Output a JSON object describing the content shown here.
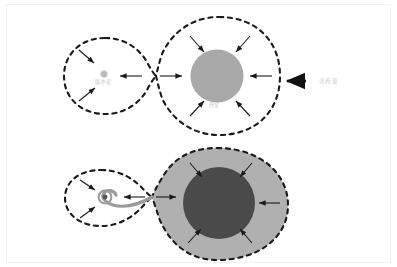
{
  "figure": {
    "background_color": "#ffffff",
    "border_color": "#f2f2f2"
  },
  "colors": {
    "dashed_stroke": "#1a1a1a",
    "companion_star_top": "#a8a8a8",
    "companion_star_bottom": "#4a4a4a",
    "roche_lobe_fill_bottom": "#b0b0b0",
    "pulsar_dot": "#a0a0a0",
    "accretion_stream": "#9a9a9a",
    "arrow_color": "#1a1a1a",
    "label_color": "#c9c9c9"
  },
  "panels": {
    "top": {
      "name": "detached-binary-panel",
      "labels": {
        "pulsar": "脉冲星",
        "companion": "伴星",
        "roche_lobe": "洛希瓣"
      }
    },
    "bottom": {
      "name": "mass-transfer-panel",
      "labels": {
        "pulsar": "",
        "companion": ""
      }
    }
  },
  "annotations": {
    "roche_lobe_pointer": "洛希瓣"
  },
  "icon_names": {
    "inward_arrow": "inward-arrow-icon",
    "outward_arrow": "outward-arrow-icon",
    "pointer_arrow": "thick-left-arrow-icon",
    "accretion_disk": "accretion-disk-icon"
  }
}
